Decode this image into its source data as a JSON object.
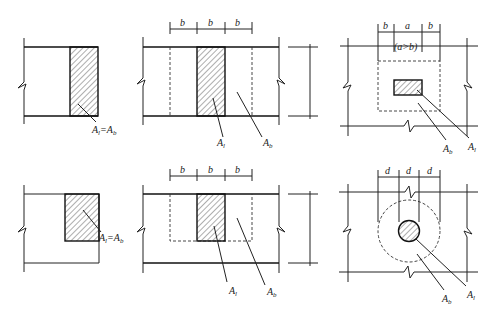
{
  "figure": {
    "panels": [
      {
        "id": "top-left",
        "labels": {
          "area": "A",
          "area_sub": "l",
          "eq": "=",
          "base": "A",
          "base_sub": "b"
        }
      },
      {
        "id": "top-middle",
        "dims": [
          "b",
          "b",
          "b"
        ],
        "labels": {
          "local": "A",
          "local_sub": "l",
          "base": "A",
          "base_sub": "b"
        }
      },
      {
        "id": "top-right",
        "dims": [
          "b",
          "a",
          "b"
        ],
        "condition": "(a>b)",
        "labels": {
          "local": "A",
          "local_sub": "l",
          "base": "A",
          "base_sub": "b"
        }
      },
      {
        "id": "bottom-left",
        "labels": {
          "area": "A",
          "area_sub": "l",
          "eq": "=",
          "base": "A",
          "base_sub": "b"
        }
      },
      {
        "id": "bottom-middle",
        "dims": [
          "b",
          "b",
          "b"
        ],
        "labels": {
          "local": "A",
          "local_sub": "l",
          "base": "A",
          "base_sub": "b"
        }
      },
      {
        "id": "bottom-right",
        "dims": [
          "d",
          "d",
          "d"
        ],
        "labels": {
          "local": "A",
          "local_sub": "l",
          "base": "A",
          "base_sub": "b"
        }
      }
    ]
  }
}
